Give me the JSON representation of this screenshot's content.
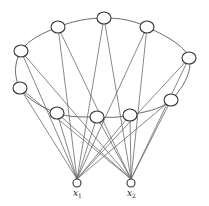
{
  "diagram": {
    "type": "graph",
    "nodes": [
      {
        "id": "n_top",
        "x": 104,
        "y": 18,
        "rx": 7,
        "ry": 6
      },
      {
        "id": "n_ul",
        "x": 58,
        "y": 27,
        "rx": 7,
        "ry": 6
      },
      {
        "id": "n_ur",
        "x": 147,
        "y": 27,
        "rx": 7,
        "ry": 6
      },
      {
        "id": "n_l",
        "x": 21,
        "y": 51,
        "rx": 7,
        "ry": 6
      },
      {
        "id": "n_r",
        "x": 189,
        "y": 58,
        "rx": 7,
        "ry": 6
      },
      {
        "id": "n_ll",
        "x": 20,
        "y": 88,
        "rx": 7,
        "ry": 6
      },
      {
        "id": "n_lr",
        "x": 171,
        "y": 100,
        "rx": 7,
        "ry": 6
      },
      {
        "id": "n_il",
        "x": 57,
        "y": 113,
        "rx": 7,
        "ry": 6
      },
      {
        "id": "n_ic",
        "x": 97,
        "y": 117,
        "rx": 7,
        "ry": 6
      },
      {
        "id": "n_ir",
        "x": 130,
        "y": 115,
        "rx": 7,
        "ry": 6
      }
    ],
    "inputs": [
      {
        "id": "x1",
        "x": 77,
        "y": 183,
        "r": 4,
        "label": "x",
        "sub": "1"
      },
      {
        "id": "x2",
        "x": 131,
        "y": 183,
        "r": 4,
        "label": "x",
        "sub": "2"
      }
    ],
    "ring_order": [
      "n_ll",
      "n_l",
      "n_ul",
      "n_top",
      "n_ur",
      "n_r",
      "n_lr",
      "n_ir",
      "n_ic",
      "n_il"
    ],
    "colors": {
      "edge": "#6a6a6a",
      "node_stroke": "#333333",
      "background": "#ffffff"
    }
  }
}
